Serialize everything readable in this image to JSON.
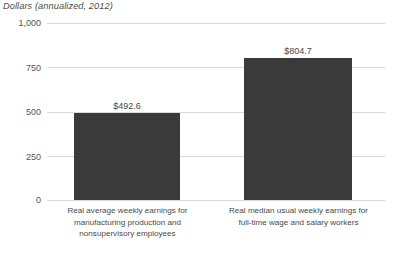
{
  "chart_data": {
    "type": "bar",
    "title": "Dollars (annualized, 2012)",
    "xlabel": "",
    "ylabel": "Dollars (annualized, 2012)",
    "categories": [
      "Real average weekly earnings for manufacturing production and nonsupervisory employees",
      "Real median usual weekly earnings for full-time wage and salary workers"
    ],
    "category_lines": [
      [
        "Real average weekly earnings for",
        "manufacturing production and",
        "nonsupervisory employees"
      ],
      [
        "Real median usual weekly earnings for",
        "full-time wage and salary workers"
      ]
    ],
    "values": [
      492.6,
      804.7
    ],
    "value_labels": [
      "$492.6",
      "$804.7"
    ],
    "ylim": [
      0,
      1000
    ],
    "yticks": [
      0,
      250,
      500,
      750,
      1000
    ],
    "ytick_labels": [
      "0",
      "250",
      "500",
      "750",
      "1,000"
    ],
    "grid": true,
    "legend": "none",
    "bar_color": "#3a3a3a",
    "gridline_color": "#d9d9d9",
    "text_color": "#4a4a4a"
  }
}
